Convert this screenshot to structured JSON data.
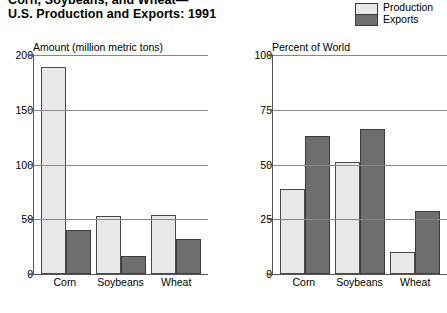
{
  "title": {
    "line1": "Corn, Soybeans, and Wheat—",
    "line2": "U.S. Production and Exports:  1991"
  },
  "legend": {
    "position": "top-right",
    "items": [
      {
        "label": "Production",
        "swatch": "light-gray-swatch",
        "color": "#e9e9e9"
      },
      {
        "label": "Exports",
        "swatch": "dark-gray-swatch",
        "color": "#6e6e6e"
      }
    ]
  },
  "colors": {
    "production": "#e9e9e9",
    "exports": "#6e6e6e",
    "axis": "#555555",
    "gridline": "#888888",
    "background": "#ffffff"
  },
  "chart_data": [
    {
      "type": "bar",
      "title": "Amount (million metric tons)",
      "xlabel": "",
      "ylabel": "Amount (million metric tons)",
      "categories": [
        "Corn",
        "Soybeans",
        "Wheat"
      ],
      "series": [
        {
          "name": "Production",
          "values": [
            189,
            53,
            54
          ]
        },
        {
          "name": "Exports",
          "values": [
            40,
            16,
            32
          ]
        }
      ],
      "ylim": [
        0,
        200
      ],
      "yticks": [
        0,
        50,
        100,
        150,
        200
      ],
      "ytick_labels": [
        "0",
        "50",
        "100",
        "150",
        "200"
      ],
      "grid": true,
      "legend_position": "outside-top-right"
    },
    {
      "type": "bar",
      "title": "Percent of World",
      "xlabel": "",
      "ylabel": "Percent of World",
      "categories": [
        "Corn",
        "Soybeans",
        "Wheat"
      ],
      "series": [
        {
          "name": "Production",
          "values": [
            39,
            51,
            10
          ]
        },
        {
          "name": "Exports",
          "values": [
            63,
            66,
            29
          ]
        }
      ],
      "ylim": [
        0,
        100
      ],
      "yticks": [
        0,
        25,
        50,
        75,
        100
      ],
      "ytick_labels": [
        "0",
        "25",
        "50",
        "75",
        "100"
      ],
      "grid": true,
      "legend_position": "outside-top-right"
    }
  ]
}
